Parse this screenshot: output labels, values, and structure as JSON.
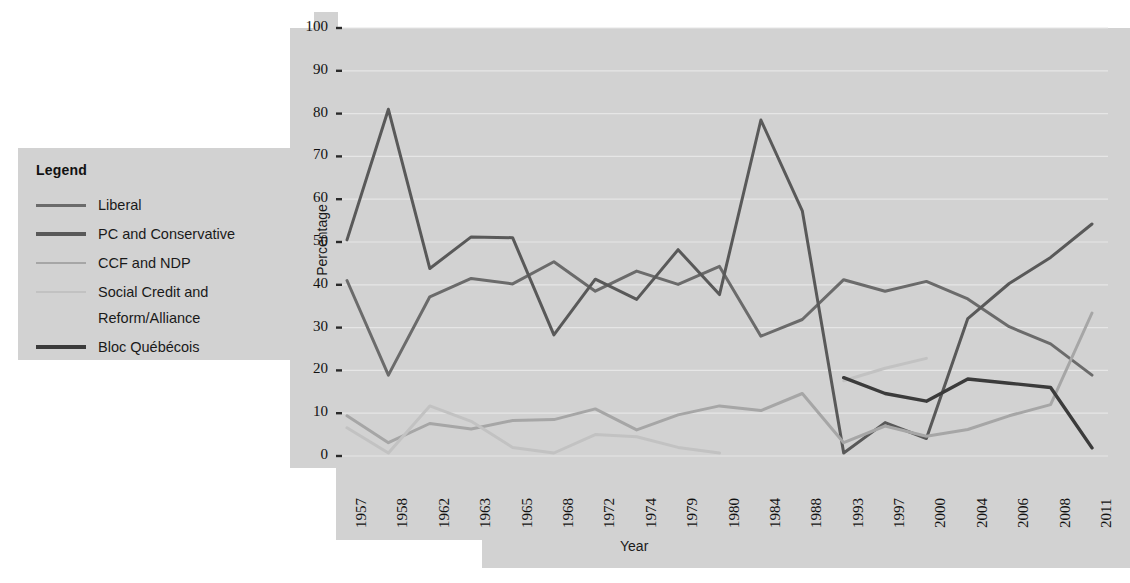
{
  "chart_data": {
    "type": "line",
    "title": "",
    "xlabel": "Year",
    "ylabel": "Percentage",
    "ylim": [
      0,
      100
    ],
    "yticks": [
      0,
      10,
      20,
      30,
      40,
      50,
      60,
      70,
      80,
      90,
      100
    ],
    "grid": true,
    "legend_position": "left-outside",
    "categories": [
      "1957",
      "1958",
      "1962",
      "1963",
      "1965",
      "1968",
      "1972",
      "1974",
      "1979",
      "1980",
      "1984",
      "1988",
      "1993",
      "1997",
      "2000",
      "2004",
      "2006",
      "2008",
      "2011"
    ],
    "series": [
      {
        "name": "Liberal",
        "color": "#6b6b6b",
        "values": [
          41.0,
          18.9,
          37.2,
          41.5,
          40.2,
          45.4,
          38.5,
          43.2,
          40.1,
          44.3,
          28.0,
          31.9,
          41.2,
          38.5,
          40.8,
          36.7,
          30.2,
          26.2,
          18.9
        ]
      },
      {
        "name": "PC and Conservative",
        "color": "#595959",
        "values": [
          50.5,
          81.0,
          43.8,
          51.2,
          51.0,
          28.3,
          41.3,
          36.6,
          48.2,
          37.7,
          78.5,
          57.3,
          0.7,
          7.8,
          4.1,
          32.1,
          40.3,
          46.4,
          54.2
        ]
      },
      {
        "name": "CCF and NDP",
        "color": "#a6a6a6",
        "values": [
          9.4,
          3.1,
          7.6,
          6.3,
          8.3,
          8.5,
          11.0,
          6.1,
          9.6,
          11.7,
          10.6,
          14.6,
          3.1,
          7.0,
          4.6,
          6.2,
          9.4,
          12.0,
          33.4
        ]
      },
      {
        "name": "Social Credit and Reform/Alliance",
        "color": "#c2c2c2",
        "values": [
          6.6,
          0.7,
          11.7,
          8.1,
          2.0,
          0.7,
          5.0,
          4.5,
          2.0,
          0.7,
          null,
          null,
          17.6,
          20.5,
          22.8,
          null,
          null,
          null,
          null
        ]
      },
      {
        "name": "Bloc Québécois",
        "color": "#3b3b3b",
        "values": [
          null,
          null,
          null,
          null,
          null,
          null,
          null,
          null,
          null,
          null,
          null,
          null,
          18.3,
          14.6,
          12.8,
          18.0,
          17.0,
          16.0,
          1.9
        ]
      }
    ]
  },
  "legend": {
    "title": "Legend",
    "items": [
      {
        "label": "Liberal",
        "color": "#6b6b6b",
        "cont": ""
      },
      {
        "label": "PC and Conservative",
        "color": "#595959",
        "cont": ""
      },
      {
        "label": "CCF and NDP",
        "color": "#a6a6a6",
        "cont": ""
      },
      {
        "label": "Social Credit and",
        "color": "#c2c2c2",
        "cont": "Reform/Alliance"
      },
      {
        "label": "Bloc Québécois",
        "color": "#3b3b3b",
        "cont": ""
      }
    ]
  },
  "axes": {
    "y_title": "Percentage",
    "x_title": "Year"
  },
  "colors": {
    "plot_background": "#d2d2d2",
    "page_background": "#ffffff",
    "gridline": "#e6e6e6",
    "text": "#1a1a1a"
  }
}
